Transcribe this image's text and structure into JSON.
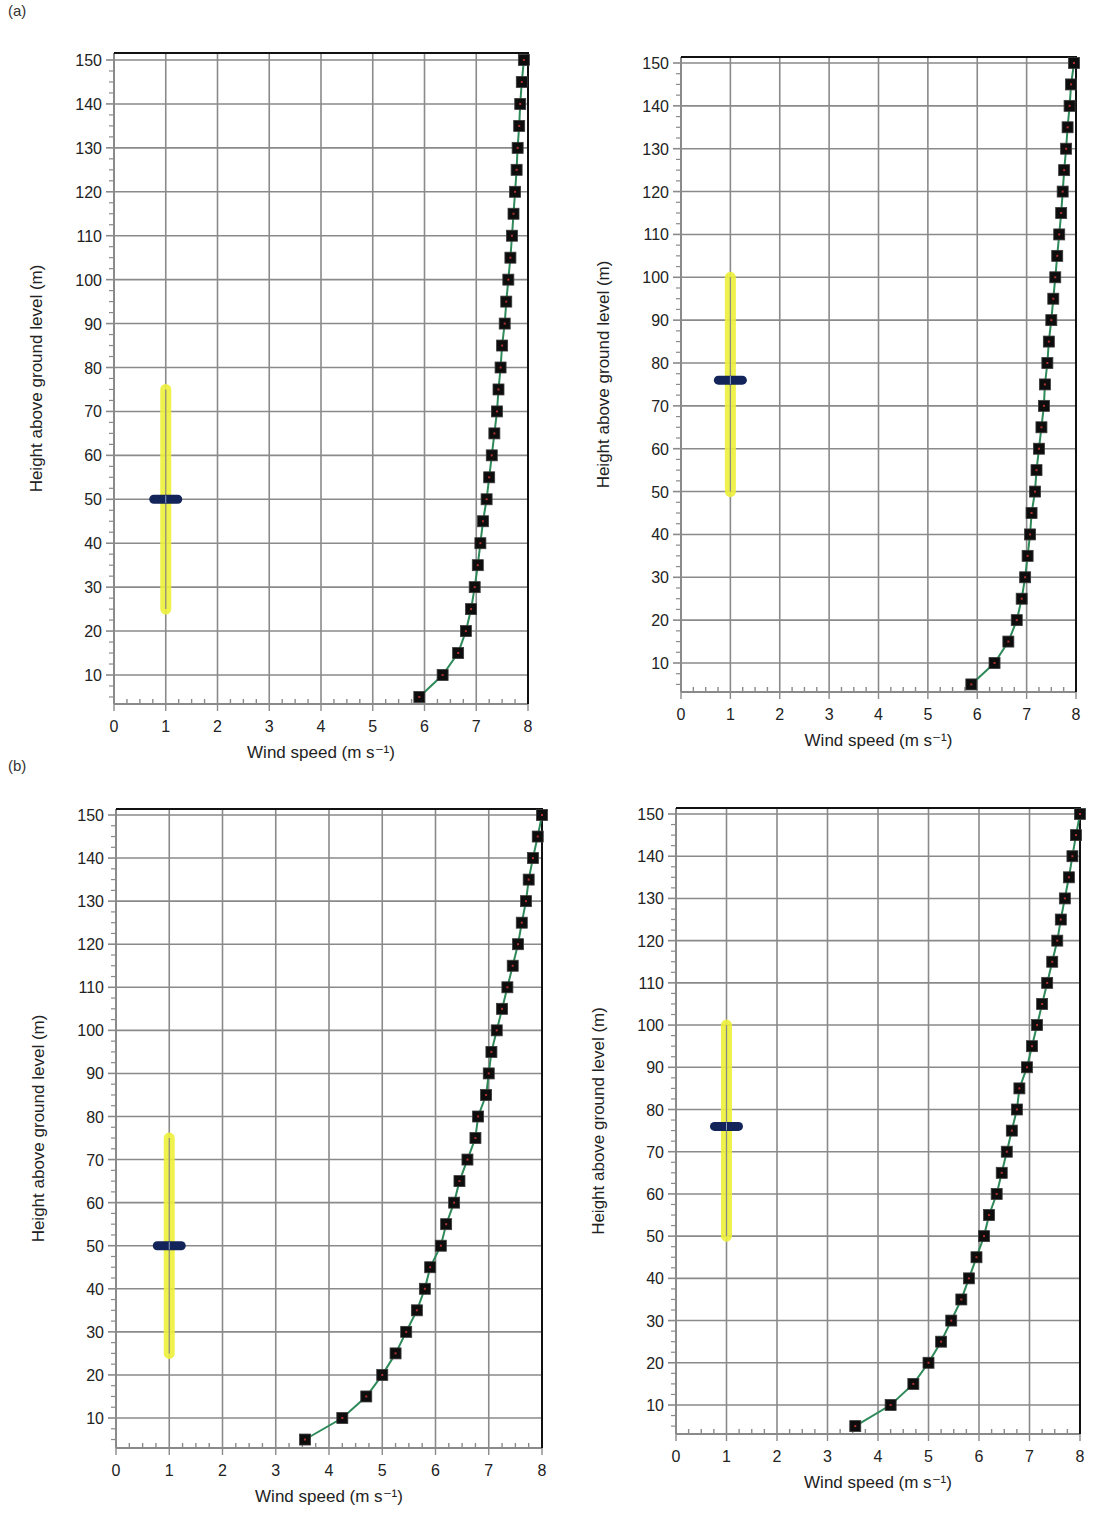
{
  "figure": {
    "panel_labels": [
      "(a)",
      "(b)"
    ]
  },
  "colors": {
    "grid": "#8a8a8a",
    "axis": "#111111",
    "profile_line": "#2f8a5a",
    "marker": "#0d0d0d",
    "hub_range": "#eef03a",
    "hub_marker": "#12245a",
    "text": "#222222"
  },
  "chart_data": [
    {
      "id": "a-left",
      "group": "(a)",
      "type": "line",
      "title": "",
      "xlabel": "Wind speed (m s⁻¹)",
      "ylabel": "Height above ground level (m)",
      "xlim": [
        0,
        8
      ],
      "ylim": [
        3,
        152
      ],
      "x_ticks": [
        0,
        1,
        2,
        3,
        4,
        5,
        6,
        7,
        8
      ],
      "y_ticks": [
        10,
        20,
        30,
        40,
        50,
        60,
        70,
        80,
        90,
        100,
        110,
        120,
        130,
        140,
        150
      ],
      "grid": true,
      "legend": null,
      "series": [
        {
          "name": "wind profile",
          "marker": "square",
          "points": [
            [
              5.9,
              5
            ],
            [
              6.35,
              10
            ],
            [
              6.65,
              15
            ],
            [
              6.8,
              20
            ],
            [
              6.9,
              25
            ],
            [
              6.97,
              30
            ],
            [
              7.03,
              35
            ],
            [
              7.08,
              40
            ],
            [
              7.13,
              45
            ],
            [
              7.2,
              50
            ],
            [
              7.25,
              55
            ],
            [
              7.3,
              60
            ],
            [
              7.35,
              65
            ],
            [
              7.4,
              70
            ],
            [
              7.43,
              75
            ],
            [
              7.47,
              80
            ],
            [
              7.5,
              85
            ],
            [
              7.55,
              90
            ],
            [
              7.58,
              95
            ],
            [
              7.62,
              100
            ],
            [
              7.66,
              105
            ],
            [
              7.69,
              110
            ],
            [
              7.72,
              115
            ],
            [
              7.75,
              120
            ],
            [
              7.78,
              125
            ],
            [
              7.8,
              130
            ],
            [
              7.83,
              135
            ],
            [
              7.85,
              140
            ],
            [
              7.88,
              145
            ],
            [
              7.92,
              150
            ]
          ]
        }
      ],
      "hub": {
        "x": 1,
        "range": [
          25,
          75
        ],
        "hub_height": 50
      }
    },
    {
      "id": "a-right",
      "group": "(a)",
      "type": "line",
      "title": "",
      "xlabel": "Wind speed (m s⁻¹)",
      "ylabel": "Height above ground level (m)",
      "xlim": [
        0,
        8
      ],
      "ylim": [
        3,
        152
      ],
      "x_ticks": [
        0,
        1,
        2,
        3,
        4,
        5,
        6,
        7,
        8
      ],
      "y_ticks": [
        10,
        20,
        30,
        40,
        50,
        60,
        70,
        80,
        90,
        100,
        110,
        120,
        130,
        140,
        150
      ],
      "grid": true,
      "legend": null,
      "series": [
        {
          "name": "wind profile",
          "marker": "square",
          "points": [
            [
              5.88,
              5
            ],
            [
              6.35,
              10
            ],
            [
              6.63,
              15
            ],
            [
              6.8,
              20
            ],
            [
              6.9,
              25
            ],
            [
              6.97,
              30
            ],
            [
              7.02,
              35
            ],
            [
              7.07,
              40
            ],
            [
              7.1,
              45
            ],
            [
              7.17,
              50
            ],
            [
              7.2,
              55
            ],
            [
              7.25,
              60
            ],
            [
              7.3,
              65
            ],
            [
              7.35,
              70
            ],
            [
              7.37,
              75
            ],
            [
              7.42,
              80
            ],
            [
              7.45,
              85
            ],
            [
              7.5,
              90
            ],
            [
              7.54,
              95
            ],
            [
              7.58,
              100
            ],
            [
              7.62,
              105
            ],
            [
              7.66,
              110
            ],
            [
              7.7,
              115
            ],
            [
              7.73,
              120
            ],
            [
              7.76,
              125
            ],
            [
              7.8,
              130
            ],
            [
              7.83,
              135
            ],
            [
              7.87,
              140
            ],
            [
              7.9,
              145
            ],
            [
              7.96,
              150
            ]
          ]
        }
      ],
      "hub": {
        "x": 1,
        "range": [
          50,
          100
        ],
        "hub_height": 76
      }
    },
    {
      "id": "b-left",
      "group": "(b)",
      "type": "line",
      "title": "",
      "xlabel": "Wind speed (m s⁻¹)",
      "ylabel": "Height above ground level (m)",
      "xlim": [
        0,
        8
      ],
      "ylim": [
        3,
        152
      ],
      "x_ticks": [
        0,
        1,
        2,
        3,
        4,
        5,
        6,
        7,
        8
      ],
      "y_ticks": [
        10,
        20,
        30,
        40,
        50,
        60,
        70,
        80,
        90,
        100,
        110,
        120,
        130,
        140,
        150
      ],
      "grid": true,
      "legend": null,
      "series": [
        {
          "name": "wind profile",
          "marker": "square",
          "points": [
            [
              3.55,
              5
            ],
            [
              4.25,
              10
            ],
            [
              4.7,
              15
            ],
            [
              5.0,
              20
            ],
            [
              5.25,
              25
            ],
            [
              5.45,
              30
            ],
            [
              5.65,
              35
            ],
            [
              5.8,
              40
            ],
            [
              5.9,
              45
            ],
            [
              6.1,
              50
            ],
            [
              6.2,
              55
            ],
            [
              6.35,
              60
            ],
            [
              6.45,
              65
            ],
            [
              6.6,
              70
            ],
            [
              6.75,
              75
            ],
            [
              6.8,
              80
            ],
            [
              6.95,
              85
            ],
            [
              7.0,
              90
            ],
            [
              7.05,
              95
            ],
            [
              7.15,
              100
            ],
            [
              7.25,
              105
            ],
            [
              7.35,
              110
            ],
            [
              7.45,
              115
            ],
            [
              7.55,
              120
            ],
            [
              7.62,
              125
            ],
            [
              7.7,
              130
            ],
            [
              7.75,
              135
            ],
            [
              7.83,
              140
            ],
            [
              7.92,
              145
            ],
            [
              8.0,
              150
            ]
          ]
        }
      ],
      "hub": {
        "x": 1,
        "range": [
          25,
          75
        ],
        "hub_height": 50
      }
    },
    {
      "id": "b-right",
      "group": "(b)",
      "type": "line",
      "title": "",
      "xlabel": "Wind speed (m s⁻¹)",
      "ylabel": "Height above ground level (m)",
      "xlim": [
        0,
        8
      ],
      "ylim": [
        3,
        152
      ],
      "x_ticks": [
        0,
        1,
        2,
        3,
        4,
        5,
        6,
        7,
        8
      ],
      "y_ticks": [
        10,
        20,
        30,
        40,
        50,
        60,
        70,
        80,
        90,
        100,
        110,
        120,
        130,
        140,
        150
      ],
      "grid": true,
      "legend": null,
      "series": [
        {
          "name": "wind profile",
          "marker": "square",
          "points": [
            [
              3.55,
              5
            ],
            [
              4.25,
              10
            ],
            [
              4.7,
              15
            ],
            [
              5.0,
              20
            ],
            [
              5.25,
              25
            ],
            [
              5.45,
              30
            ],
            [
              5.65,
              35
            ],
            [
              5.8,
              40
            ],
            [
              5.95,
              45
            ],
            [
              6.1,
              50
            ],
            [
              6.2,
              55
            ],
            [
              6.35,
              60
            ],
            [
              6.45,
              65
            ],
            [
              6.55,
              70
            ],
            [
              6.65,
              75
            ],
            [
              6.75,
              80
            ],
            [
              6.8,
              85
            ],
            [
              6.95,
              90
            ],
            [
              7.05,
              95
            ],
            [
              7.15,
              100
            ],
            [
              7.25,
              105
            ],
            [
              7.35,
              110
            ],
            [
              7.45,
              115
            ],
            [
              7.55,
              120
            ],
            [
              7.62,
              125
            ],
            [
              7.7,
              130
            ],
            [
              7.78,
              135
            ],
            [
              7.85,
              140
            ],
            [
              7.92,
              145
            ],
            [
              8.0,
              150
            ]
          ]
        }
      ],
      "hub": {
        "x": 1,
        "range": [
          50,
          100
        ],
        "hub_height": 76
      }
    }
  ],
  "layout": {
    "panels": [
      {
        "id": "a-left",
        "x0": 114,
        "x8": 528,
        "y10": 675,
        "y150": 60,
        "bottom": 704,
        "top": 53
      },
      {
        "id": "a-right",
        "x0": 681,
        "x8": 1076,
        "y10": 663,
        "y150": 63,
        "bottom": 692,
        "top": 57
      },
      {
        "id": "b-left",
        "x0": 116,
        "x8": 542,
        "y10": 1418,
        "y150": 815,
        "bottom": 1448,
        "top": 809
      },
      {
        "id": "b-right",
        "x0": 676,
        "x8": 1080,
        "y10": 1405,
        "y150": 814,
        "bottom": 1434,
        "top": 808
      }
    ],
    "label_positions": [
      {
        "text_index": 0,
        "left": 8,
        "top": 2
      },
      {
        "text_index": 1,
        "left": 8,
        "top": 757
      }
    ]
  }
}
